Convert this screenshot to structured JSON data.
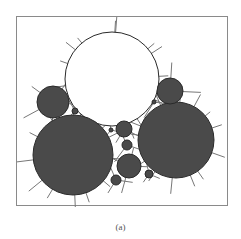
{
  "figure": {
    "caption": "(a)",
    "colors": {
      "dark_particle": "#4a4a4a",
      "light_particle": "#ffffff",
      "outline": "#2a2a2a",
      "fiber": "#777777",
      "border": "#8a8a8a"
    },
    "particles": [
      {
        "id": "large-white",
        "cx": 111,
        "cy": 78,
        "r": 47,
        "fill": "light"
      },
      {
        "id": "large-dark-left",
        "cx": 72,
        "cy": 154,
        "r": 40,
        "fill": "dark"
      },
      {
        "id": "large-dark-right",
        "cx": 175,
        "cy": 139,
        "r": 38,
        "fill": "dark"
      },
      {
        "id": "medium-dark-left",
        "cx": 52,
        "cy": 101,
        "r": 16,
        "fill": "dark"
      },
      {
        "id": "medium-dark-right",
        "cx": 169,
        "cy": 90,
        "r": 13,
        "fill": "dark"
      },
      {
        "id": "small-center-top",
        "cx": 123,
        "cy": 128,
        "r": 8,
        "fill": "dark"
      },
      {
        "id": "small-center-mid",
        "cx": 126,
        "cy": 144,
        "r": 5,
        "fill": "dark"
      },
      {
        "id": "medium-center-bottom",
        "cx": 128,
        "cy": 165,
        "r": 12,
        "fill": "dark"
      },
      {
        "id": "small-bottom-left",
        "cx": 115,
        "cy": 179,
        "r": 5,
        "fill": "dark"
      },
      {
        "id": "small-bottom-right",
        "cx": 148,
        "cy": 173,
        "r": 4,
        "fill": "dark"
      },
      {
        "id": "tiny-left",
        "cx": 74,
        "cy": 110,
        "r": 3,
        "fill": "dark"
      },
      {
        "id": "tiny-center",
        "cx": 110,
        "cy": 129,
        "r": 2,
        "fill": "dark"
      },
      {
        "id": "tiny-right",
        "cx": 153,
        "cy": 101,
        "r": 2,
        "fill": "dark"
      }
    ]
  }
}
